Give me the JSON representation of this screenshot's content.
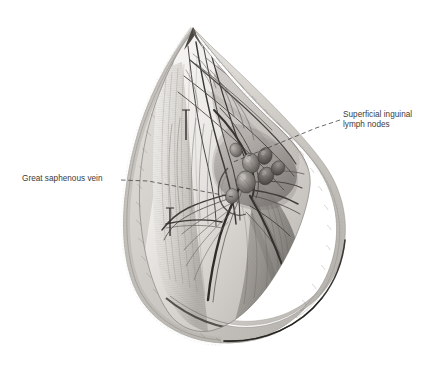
{
  "figure": {
    "type": "anatomical-illustration",
    "medium": "graphite pencil drawing",
    "background_color": "#ffffff",
    "ink_color": "#3b3b3c"
  },
  "annotations": [
    {
      "id": "lymph-nodes",
      "line1": "Superficial inguinal",
      "line2": "lymph nodes",
      "position": "right",
      "leader": "dashed"
    },
    {
      "id": "saphenous-vein",
      "line1": "Great saphenous vein",
      "line2": "",
      "position": "left",
      "leader": "dashed"
    }
  ],
  "leader_lines": {
    "lymph_nodes_dash": "M 340 120 L 316 128 L 231 163",
    "saphenous_dash": "M 120 180 L 147 181 L 232 196"
  }
}
